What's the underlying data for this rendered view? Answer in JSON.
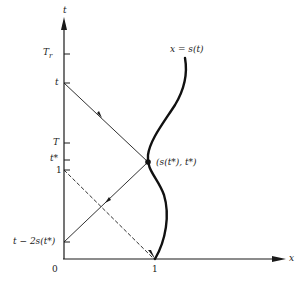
{
  "diagram": {
    "axes": {
      "y_label": "t",
      "x_label": "x",
      "origin_label": "0",
      "x_tick_label": "1"
    },
    "y_ticks": [
      {
        "label": "T_r",
        "display_main": "T",
        "display_sub": "r"
      },
      {
        "label": "t"
      },
      {
        "label": "T"
      },
      {
        "label": "t*"
      },
      {
        "label": "1"
      },
      {
        "label": "t − 2s(t*)"
      }
    ],
    "curve_label": "x = s(t)",
    "point_label": "(s(t*), t*)",
    "colors": {
      "line": "#1a1a1a",
      "background": "#ffffff"
    }
  }
}
